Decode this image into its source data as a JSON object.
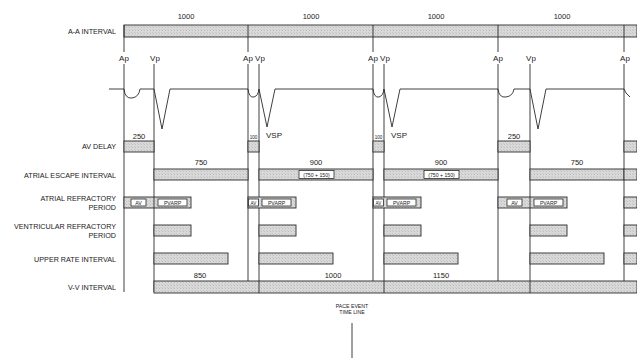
{
  "row_labels": {
    "aa_interval": "A-A INTERVAL",
    "av_delay": "AV DELAY",
    "atrial_escape": "ATRIAL ESCAPE INTERVAL",
    "arp_line1": "ATRIAL REFRACTORY",
    "arp_line2": "PERIOD",
    "vrp_line1": "VENTRICULAR REFRACTORY",
    "vrp_line2": "PERIOD",
    "upper_rate": "UPPER RATE INTERVAL",
    "vv_interval": "V-V INTERVAL"
  },
  "aa_interval_values": [
    "1000",
    "1000",
    "1000",
    "1000"
  ],
  "events": [
    {
      "label": "Ap",
      "type": "atrial"
    },
    {
      "label": "Vp",
      "type": "ventricular"
    },
    {
      "label": "Ap",
      "type": "atrial"
    },
    {
      "label": "Vp",
      "type": "ventricular"
    },
    {
      "label": "Ap",
      "type": "atrial"
    },
    {
      "label": "Vp",
      "type": "ventricular"
    },
    {
      "label": "Ap",
      "type": "atrial"
    },
    {
      "label": "Vp",
      "type": "ventricular"
    },
    {
      "label": "Ap",
      "type": "atrial"
    }
  ],
  "vsp_label": "VSP",
  "av_delay_values": [
    "250",
    "100",
    "100",
    "250"
  ],
  "atrial_escape_values": [
    "750",
    "900",
    "900",
    "750"
  ],
  "atrial_escape_notes": [
    "",
    "(750 + 150)",
    "(750 + 150)",
    ""
  ],
  "arp_box_labels": {
    "av": "AV",
    "pvarp": "PVARP"
  },
  "vv_interval_values": [
    "850",
    "1000",
    "1150"
  ],
  "timeline_label_line1": "PACE EVENT",
  "timeline_label_line2": "TIME LINE",
  "colors": {
    "line": "#2a2a2a",
    "bar_fill": "#d8d8d8",
    "background": "#ffffff"
  }
}
